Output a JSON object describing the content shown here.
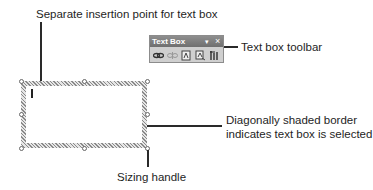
{
  "annotations": {
    "insertion_point": "Separate insertion point for text box",
    "toolbar": "Text box toolbar",
    "border_line1": "Diagonally shaded border",
    "border_line2": "indicates text box is selected",
    "sizing_handle": "Sizing handle"
  },
  "toolbar": {
    "title": "Text Box",
    "menu_glyph": "▾",
    "close_glyph": "×",
    "buttons": [
      {
        "name": "create-text-box-link",
        "icon": "link-icon",
        "enabled": true
      },
      {
        "name": "break-forward-link",
        "icon": "break-link-icon",
        "enabled": false
      },
      {
        "name": "previous-text-box",
        "icon": "previous-text-box-icon",
        "enabled": true
      },
      {
        "name": "next-text-box",
        "icon": "next-text-box-icon",
        "enabled": true
      },
      {
        "name": "change-text-direction",
        "icon": "text-direction-icon",
        "enabled": true
      }
    ]
  },
  "colors": {
    "toolbar_bg": "#cfcfcf",
    "toolbar_title_bg": "#7a7a7a",
    "line": "#2a2a2a"
  }
}
